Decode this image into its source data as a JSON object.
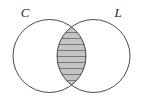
{
  "figure": {
    "kind": "venn-diagram",
    "title": "",
    "width": 143,
    "height": 105,
    "background_color": "#ffffff"
  },
  "labels": {
    "left_set": "C",
    "right_set": "L"
  },
  "sets": [
    {
      "id": "left-circle",
      "label": "C",
      "center_x": 49.5,
      "center_y": 56,
      "radius": 36.5,
      "stroke_color": "#4a4a4a",
      "stroke_width": 1,
      "fill_color": "none"
    },
    {
      "id": "right-circle",
      "label": "L",
      "center_x": 93.5,
      "center_y": 56,
      "radius": 36.5,
      "stroke_color": "#4a4a4a",
      "stroke_width": 1,
      "fill_color": "none"
    }
  ],
  "shaded_region": {
    "id": "intersection",
    "description": "C intersect L",
    "fill_color": "#c4c4c4",
    "hatch_color": "#787878",
    "hatch_orientation": "horizontal",
    "hatch_spacing": 6,
    "hatch_width": 1,
    "top_vertex_x": 71.5,
    "top_vertex_y": 25.5,
    "bottom_vertex_x": 71.5,
    "bottom_vertex_y": 86.5,
    "left_edge_x": 57,
    "right_edge_x": 86
  },
  "label_positions": {
    "left": {
      "x": 25,
      "y": 17
    },
    "right": {
      "x": 118,
      "y": 17
    }
  }
}
